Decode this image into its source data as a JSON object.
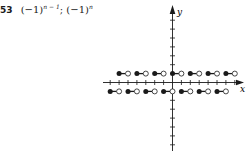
{
  "problem": {
    "number": "53",
    "expr1_base": "(−1)",
    "expr1_exp": "n − 1",
    "separator": ";",
    "expr2_base": "(−1)",
    "expr2_exp": "n"
  },
  "chart_data": {
    "type": "step",
    "title": "",
    "xlabel": "x",
    "ylabel": "y",
    "xlim": [
      -8,
      8
    ],
    "ylim": [
      -8,
      8
    ],
    "grid": false,
    "legend": null,
    "tick_spacing": 1,
    "segments": [
      {
        "x_start": -6,
        "x_end": -5,
        "y": 1,
        "left": "closed",
        "right": "open"
      },
      {
        "x_start": -4,
        "x_end": -3,
        "y": 1,
        "left": "closed",
        "right": "open"
      },
      {
        "x_start": -2,
        "x_end": -1,
        "y": 1,
        "left": "closed",
        "right": "open"
      },
      {
        "x_start": 0,
        "x_end": 1,
        "y": 1,
        "left": "closed",
        "right": "open"
      },
      {
        "x_start": 2,
        "x_end": 3,
        "y": 1,
        "left": "closed",
        "right": "open"
      },
      {
        "x_start": 4,
        "x_end": 5,
        "y": 1,
        "left": "closed",
        "right": "open"
      },
      {
        "x_start": 6,
        "x_end": 7,
        "y": 1,
        "left": "closed",
        "right": "open"
      },
      {
        "x_start": -7,
        "x_end": -6,
        "y": -1,
        "left": "closed",
        "right": "open"
      },
      {
        "x_start": -5,
        "x_end": -4,
        "y": -1,
        "left": "closed",
        "right": "open"
      },
      {
        "x_start": -3,
        "x_end": -2,
        "y": -1,
        "left": "closed",
        "right": "open"
      },
      {
        "x_start": -1,
        "x_end": 0,
        "y": -1,
        "left": "closed",
        "right": "open"
      },
      {
        "x_start": 1,
        "x_end": 2,
        "y": -1,
        "left": "closed",
        "right": "open"
      },
      {
        "x_start": 3,
        "x_end": 4,
        "y": -1,
        "left": "closed",
        "right": "open"
      },
      {
        "x_start": 5,
        "x_end": 6,
        "y": -1,
        "left": "closed",
        "right": "open"
      }
    ]
  },
  "colors": {
    "ink": "#1a1a1a",
    "background": "#ffffff"
  }
}
